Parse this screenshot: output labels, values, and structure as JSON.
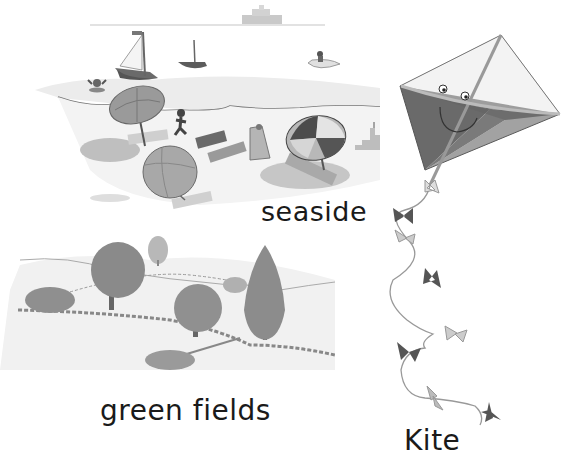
{
  "labels": {
    "seaside": "seaside",
    "green_fields": "green fields",
    "kite": "Kite"
  },
  "scenes": [
    {
      "id": "seaside",
      "elements": [
        "ship-on-horizon",
        "sailboat",
        "small-sailboat",
        "swimmer",
        "person-in-dinghy",
        "beach-umbrellas",
        "towels",
        "child-running",
        "deckchair",
        "sandcastle"
      ]
    },
    {
      "id": "green-fields",
      "elements": [
        "rolling-hills",
        "trees",
        "stone-walls",
        "hedgerows"
      ]
    },
    {
      "id": "kite",
      "elements": [
        "smiling-kite",
        "kite-string",
        "bows"
      ]
    }
  ],
  "colors": {
    "background": "#ffffff",
    "text": "#1a1a1a",
    "ink_dark": "#555555",
    "ink_mid": "#8a8a8a",
    "ink_light": "#c8c8c8"
  }
}
